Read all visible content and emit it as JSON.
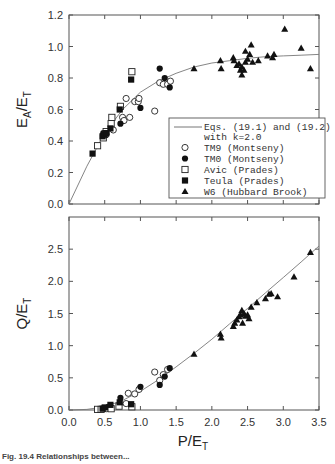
{
  "chart_data": [
    {
      "type": "scatter",
      "panel": "top",
      "title": "",
      "xlabel": "",
      "ylabel": "E_A/E_T",
      "ylabel_main": "E",
      "ylabel_sub1": "A",
      "ylabel_mid": "/E",
      "ylabel_sub2": "T",
      "xlim": [
        0.0,
        3.5
      ],
      "ylim": [
        0.0,
        1.2
      ],
      "yticks": [
        "0.0",
        "0.2",
        "0.4",
        "0.6",
        "0.8",
        "1.0",
        "1.2"
      ],
      "grid": false,
      "legend_position": "lower right (inset)",
      "legend": [
        {
          "marker": "line",
          "label": "Eqs. (19.1) and (19.2)",
          "label2": "with k=2.0"
        },
        {
          "marker": "open-circle",
          "label": "TM9 (Montseny)"
        },
        {
          "marker": "filled-circle",
          "label": "TM0 (Montseny)"
        },
        {
          "marker": "open-square",
          "label": "Avic (Prades)"
        },
        {
          "marker": "filled-square",
          "label": "Teula (Prades)"
        },
        {
          "marker": "filled-triangle",
          "label": "W6 (Hubbard Brook)"
        }
      ],
      "curve": {
        "name": "Eqs. (19.1) and (19.2) with k=2.0",
        "x": [
          0.0,
          0.25,
          0.5,
          0.75,
          1.0,
          1.25,
          1.5,
          1.75,
          2.0,
          2.25,
          2.5,
          2.75,
          3.0,
          3.25,
          3.5
        ],
        "y": [
          0.0,
          0.24,
          0.45,
          0.6,
          0.71,
          0.78,
          0.83,
          0.87,
          0.895,
          0.91,
          0.925,
          0.935,
          0.94,
          0.945,
          0.95
        ]
      },
      "series": [
        {
          "name": "TM9 (Montseny)",
          "marker": "open-circle",
          "points": [
            [
              0.52,
              0.44
            ],
            [
              0.62,
              0.47
            ],
            [
              0.75,
              0.55
            ],
            [
              0.77,
              0.53
            ],
            [
              0.8,
              0.67
            ],
            [
              0.85,
              0.55
            ],
            [
              0.92,
              0.65
            ],
            [
              0.97,
              0.65
            ],
            [
              0.98,
              0.67
            ],
            [
              1.2,
              0.59
            ],
            [
              1.27,
              0.77
            ],
            [
              1.32,
              0.76
            ],
            [
              1.38,
              0.76
            ],
            [
              1.42,
              0.78
            ]
          ]
        },
        {
          "name": "TM0 (Montseny)",
          "marker": "filled-circle",
          "points": [
            [
              0.48,
              0.45
            ],
            [
              0.72,
              0.51
            ],
            [
              1.0,
              0.61
            ],
            [
              1.27,
              0.86
            ],
            [
              1.34,
              0.8
            ],
            [
              1.41,
              0.74
            ]
          ]
        },
        {
          "name": "Avic (Prades)",
          "marker": "open-square",
          "points": [
            [
              0.4,
              0.37
            ],
            [
              0.48,
              0.42
            ],
            [
              0.52,
              0.46
            ],
            [
              0.59,
              0.51
            ],
            [
              0.6,
              0.55
            ],
            [
              0.72,
              0.62
            ],
            [
              0.88,
              0.84
            ]
          ]
        },
        {
          "name": "Teula (Prades)",
          "marker": "filled-square",
          "points": [
            [
              0.33,
              0.32
            ],
            [
              0.47,
              0.43
            ],
            [
              0.5,
              0.44
            ],
            [
              0.52,
              0.45
            ],
            [
              0.58,
              0.48
            ],
            [
              0.71,
              0.6
            ],
            [
              0.87,
              0.79
            ]
          ]
        },
        {
          "name": "W6 (Hubbard Brook)",
          "marker": "filled-triangle",
          "points": [
            [
              1.75,
              0.86
            ],
            [
              2.12,
              0.91
            ],
            [
              2.13,
              0.86
            ],
            [
              2.3,
              0.93
            ],
            [
              2.31,
              0.91
            ],
            [
              2.35,
              0.88
            ],
            [
              2.38,
              0.89
            ],
            [
              2.4,
              0.85
            ],
            [
              2.42,
              0.87
            ],
            [
              2.42,
              0.82
            ],
            [
              2.45,
              0.85
            ],
            [
              2.47,
              0.9
            ],
            [
              2.47,
              0.97
            ],
            [
              2.5,
              0.92
            ],
            [
              2.53,
              0.95
            ],
            [
              2.55,
              1.01
            ],
            [
              2.57,
              0.9
            ],
            [
              2.65,
              0.91
            ],
            [
              2.78,
              0.94
            ],
            [
              2.85,
              0.93
            ],
            [
              2.87,
              0.95
            ],
            [
              3.02,
              1.11
            ],
            [
              3.25,
              0.99
            ],
            [
              3.38,
              0.86
            ]
          ]
        }
      ]
    },
    {
      "type": "scatter",
      "panel": "bottom",
      "title": "",
      "xlabel": "P/E_T",
      "xlabel_main": "P/E",
      "xlabel_sub": "T",
      "ylabel": "Q/E_T",
      "ylabel_main": "Q/E",
      "ylabel_sub": "T",
      "xlim": [
        0.0,
        3.5
      ],
      "ylim": [
        0.0,
        3.0
      ],
      "xticks": [
        "0.0",
        "0.5",
        "1.0",
        "1.5",
        "2.0",
        "2.5",
        "3.0",
        "3.5"
      ],
      "yticks": [
        "0.0",
        "0.5",
        "1.0",
        "1.5",
        "2.0",
        "2.5"
      ],
      "grid": false,
      "curve": {
        "name": "Eqs. (19.1) and (19.2) with k=2.0",
        "x": [
          0.0,
          0.25,
          0.5,
          0.75,
          1.0,
          1.25,
          1.5,
          1.75,
          2.0,
          2.25,
          2.5,
          2.75,
          3.0,
          3.25,
          3.5
        ],
        "y": [
          0.0,
          0.01,
          0.05,
          0.15,
          0.29,
          0.47,
          0.67,
          0.88,
          1.1,
          1.34,
          1.58,
          1.82,
          2.06,
          2.3,
          2.55
        ]
      },
      "series": [
        {
          "name": "TM9 (Montseny)",
          "marker": "open-circle",
          "points": [
            [
              0.52,
              0.02
            ],
            [
              0.8,
              0.1
            ],
            [
              0.83,
              0.26
            ],
            [
              0.92,
              0.25
            ],
            [
              0.98,
              0.32
            ],
            [
              1.2,
              0.59
            ],
            [
              1.27,
              0.46
            ],
            [
              1.32,
              0.55
            ],
            [
              1.38,
              0.63
            ]
          ]
        },
        {
          "name": "TM0 (Montseny)",
          "marker": "filled-circle",
          "points": [
            [
              0.48,
              0.03
            ],
            [
              0.55,
              0.05
            ],
            [
              0.72,
              0.19
            ],
            [
              1.0,
              0.36
            ],
            [
              1.27,
              0.39
            ],
            [
              1.34,
              0.52
            ],
            [
              1.41,
              0.65
            ]
          ]
        },
        {
          "name": "Avic (Prades)",
          "marker": "open-square",
          "points": [
            [
              0.4,
              0.01
            ],
            [
              0.45,
              0.01
            ],
            [
              0.59,
              0.02
            ],
            [
              0.7,
              0.06
            ],
            [
              0.88,
              0.05
            ]
          ]
        },
        {
          "name": "Teula (Prades)",
          "marker": "filled-square",
          "points": [
            [
              0.47,
              0.02
            ],
            [
              0.5,
              0.04
            ],
            [
              0.58,
              0.08
            ],
            [
              0.71,
              0.12
            ],
            [
              0.87,
              0.09
            ]
          ]
        },
        {
          "name": "W6 (Hubbard Brook)",
          "marker": "filled-triangle",
          "points": [
            [
              1.75,
              0.87
            ],
            [
              2.12,
              1.18
            ],
            [
              2.13,
              1.12
            ],
            [
              2.3,
              1.3
            ],
            [
              2.32,
              1.35
            ],
            [
              2.35,
              1.4
            ],
            [
              2.38,
              1.45
            ],
            [
              2.4,
              1.48
            ],
            [
              2.42,
              1.55
            ],
            [
              2.43,
              1.35
            ],
            [
              2.45,
              1.5
            ],
            [
              2.47,
              1.46
            ],
            [
              2.5,
              1.48
            ],
            [
              2.52,
              1.42
            ],
            [
              2.55,
              1.6
            ],
            [
              2.63,
              1.67
            ],
            [
              2.75,
              1.73
            ],
            [
              2.8,
              1.8
            ],
            [
              2.83,
              1.81
            ],
            [
              2.92,
              1.76
            ],
            [
              3.15,
              2.07
            ],
            [
              3.38,
              2.45
            ]
          ]
        }
      ]
    }
  ],
  "caption": "Fig. 19.4  Relationships between..."
}
